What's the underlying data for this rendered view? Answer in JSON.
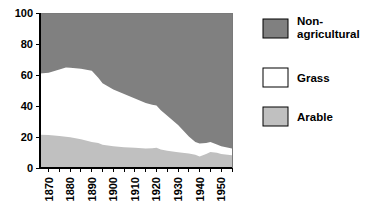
{
  "chart_data": {
    "type": "area",
    "title": "",
    "subtitle": "",
    "xlabel": "",
    "ylabel": "",
    "stacked": true,
    "grid": false,
    "legend_position": "right",
    "xlim": [
      1866,
      1955
    ],
    "ylim": [
      0,
      100
    ],
    "ytick_labels": [
      "0",
      "20",
      "40",
      "60",
      "80",
      "100"
    ],
    "ytick_values": [
      0,
      20,
      40,
      60,
      80,
      100
    ],
    "xtick_labels": [
      "1870",
      "1880",
      "1890",
      "1900",
      "1910",
      "1920",
      "1930",
      "1940",
      "1950"
    ],
    "xtick_values": [
      1870,
      1880,
      1890,
      1900,
      1910,
      1920,
      1930,
      1940,
      1950
    ],
    "x_minor_interval": 5,
    "x": [
      1866,
      1870,
      1875,
      1878,
      1880,
      1885,
      1890,
      1893,
      1895,
      1900,
      1905,
      1910,
      1915,
      1918,
      1920,
      1922,
      1925,
      1930,
      1935,
      1938,
      1940,
      1943,
      1945,
      1948,
      1950,
      1955
    ],
    "series": [
      {
        "name": "Arable",
        "color": "#c0c0c0",
        "values": [
          21.5,
          21.3,
          20.6,
          20.2,
          19.9,
          18.6,
          16.8,
          16.2,
          15.0,
          14.0,
          13.4,
          13.0,
          12.6,
          12.8,
          13.0,
          12.0,
          11.1,
          10.2,
          9.4,
          8.6,
          7.4,
          9.0,
          10.4,
          9.8,
          9.0,
          8.2
        ]
      },
      {
        "name": "Grass",
        "color": "#ffffff",
        "values": [
          39.4,
          40.2,
          43.0,
          44.6,
          44.8,
          45.4,
          46.0,
          42.0,
          39.6,
          36.6,
          34.3,
          31.8,
          29.4,
          28.0,
          27.3,
          25.2,
          22.6,
          17.6,
          11.0,
          8.2,
          8.4,
          7.2,
          6.4,
          5.4,
          5.0,
          4.4
        ]
      },
      {
        "name": "Non-agricultural",
        "color": "#808080",
        "values": [
          39.1,
          38.5,
          36.4,
          35.2,
          35.3,
          36.0,
          37.2,
          41.8,
          45.4,
          49.4,
          52.3,
          55.2,
          58.0,
          59.2,
          59.7,
          62.8,
          66.3,
          72.2,
          79.6,
          83.2,
          84.2,
          83.8,
          83.2,
          84.8,
          86.0,
          87.4
        ]
      }
    ],
    "stack_tops": {
      "arable": [
        21.5,
        21.3,
        20.6,
        20.2,
        19.9,
        18.6,
        16.8,
        16.2,
        15.0,
        14.0,
        13.4,
        13.0,
        12.6,
        12.8,
        13.0,
        12.0,
        11.1,
        10.2,
        9.4,
        8.6,
        7.4,
        9.0,
        10.4,
        9.8,
        9.0,
        8.2
      ],
      "agricultural_total": [
        60.9,
        61.5,
        63.6,
        64.8,
        64.7,
        64.0,
        62.8,
        58.2,
        54.6,
        50.6,
        47.7,
        44.8,
        42.0,
        40.8,
        40.3,
        37.2,
        33.7,
        27.8,
        20.4,
        16.8,
        15.8,
        16.2,
        16.8,
        15.2,
        14.0,
        12.6
      ]
    }
  },
  "legend": {
    "items": [
      {
        "label": "Non-agricultural",
        "label_line1": "Non-",
        "label_line2": "agricultural",
        "color": "#808080",
        "swatch_name": "legend-swatch-non-agricultural"
      },
      {
        "label": "Grass",
        "label_line1": "Grass",
        "label_line2": "",
        "color": "#ffffff",
        "swatch_name": "legend-swatch-grass"
      },
      {
        "label": "Arable",
        "label_line1": "Arable",
        "label_line2": "",
        "color": "#c0c0c0",
        "swatch_name": "legend-swatch-arable"
      }
    ]
  },
  "axes": {
    "y": {
      "labels": [
        "100",
        "80",
        "60",
        "40",
        "20",
        "0"
      ]
    },
    "x": {
      "labels": [
        "1870",
        "1880",
        "1890",
        "1900",
        "1910",
        "1920",
        "1930",
        "1940",
        "1950"
      ]
    }
  }
}
